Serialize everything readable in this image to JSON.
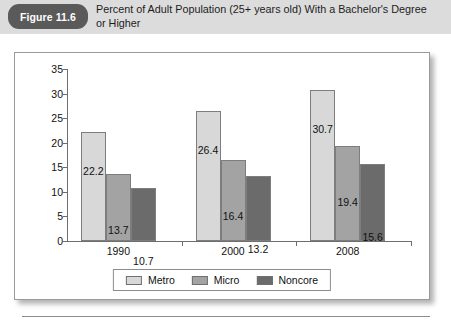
{
  "header": {
    "figure_badge": "Figure 11.6",
    "caption": "Percent of Adult Population (25+ years old) With a Bachelor's Degree or Higher"
  },
  "colors": {
    "header_band": "#dcdcdc",
    "badge": "#5a5a5a",
    "metro": "#d8d8d8",
    "micro": "#a3a3a3",
    "noncore": "#6b6b6b",
    "axis": "#6e6e6e",
    "frame_border": "#9a9a9a"
  },
  "chart_data": {
    "type": "bar",
    "title": "Percent of Adult Population (25+ years old) With a Bachelor's Degree or Higher",
    "xlabel": "",
    "ylabel": "",
    "categories": [
      "1990",
      "2000",
      "2008"
    ],
    "yticks": [
      0,
      5,
      10,
      15,
      20,
      25,
      30,
      35
    ],
    "ylim": [
      0,
      35
    ],
    "grid": false,
    "legend_position": "bottom",
    "series": [
      {
        "name": "Metro",
        "color": "#d8d8d8",
        "values": [
          22.2,
          26.4,
          30.7
        ]
      },
      {
        "name": "Micro",
        "color": "#a3a3a3",
        "values": [
          13.7,
          16.4,
          19.4
        ]
      },
      {
        "name": "Noncore",
        "color": "#6b6b6b",
        "values": [
          10.7,
          13.2,
          15.6
        ]
      }
    ]
  }
}
